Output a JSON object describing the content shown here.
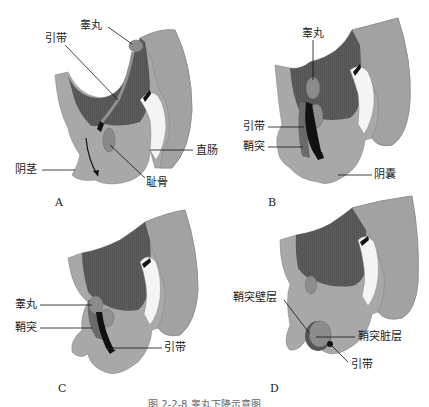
{
  "colors": {
    "body_light": "#a8a8a8",
    "body_dark": "#5a5a5a",
    "white_cavity": "#f4f4f4",
    "testis": "#8c8c8c",
    "gubernaculum": "#111111",
    "outline": "#777777"
  },
  "panels": [
    {
      "letter": "A",
      "labels": {
        "testis": "睾丸",
        "gubernaculum": "引带",
        "penis": "阴茎",
        "rectum": "直肠",
        "pubis": "耻骨"
      }
    },
    {
      "letter": "B",
      "labels": {
        "testis": "睾丸",
        "gubernaculum": "引带",
        "processus_vaginalis": "鞘突",
        "scrotum": "阴囊"
      }
    },
    {
      "letter": "C",
      "labels": {
        "testis": "睾丸",
        "processus_vaginalis": "鞘突",
        "gubernaculum": "引带"
      }
    },
    {
      "letter": "D",
      "labels": {
        "parietal_layer": "鞘突壁层",
        "visceral_layer": "鞘突脏层",
        "gubernaculum": "引带"
      }
    }
  ],
  "caption": "图 2-2-8   睾丸下降示意图"
}
